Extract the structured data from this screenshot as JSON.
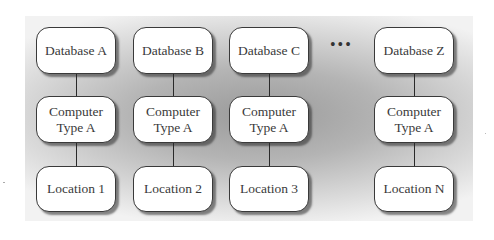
{
  "diagram": {
    "columns": [
      {
        "database": "Database A",
        "computer": "Computer\nType A",
        "location": "Location 1"
      },
      {
        "database": "Database B",
        "computer": "Computer\nType A",
        "location": "Location 2"
      },
      {
        "database": "Database C",
        "computer": "Computer\nType A",
        "location": "Location 3"
      },
      {
        "database": "Database Z",
        "computer": "Computer\nType A",
        "location": "Location N"
      }
    ],
    "ellipsis": "•••",
    "computer_line1": "Computer",
    "computer_line2": "Type A"
  },
  "colors": {
    "node_fill": "#ffffff",
    "node_border": "#3a3a3a",
    "panel_center": "#9a9a9a",
    "panel_edge": "#f2f2f2"
  }
}
